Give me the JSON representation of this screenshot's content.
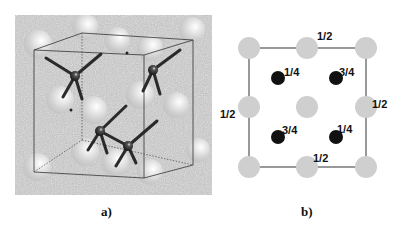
{
  "figure": {
    "panels": [
      {
        "id": "a",
        "label": "a)",
        "description": "3D perspective view of a cubic unit cell with large light spheres and small dark tetrahedrally bonded atoms",
        "background": "#bdbdbd",
        "large_spheres": [
          {
            "x": 38,
            "y": 44,
            "r": 14
          },
          {
            "x": 85,
            "y": 27,
            "r": 13
          },
          {
            "x": 117,
            "y": 40,
            "r": 13
          },
          {
            "x": 150,
            "y": 48,
            "r": 13
          },
          {
            "x": 192,
            "y": 30,
            "r": 13
          },
          {
            "x": 60,
            "y": 100,
            "r": 14
          },
          {
            "x": 93,
            "y": 110,
            "r": 14
          },
          {
            "x": 140,
            "y": 95,
            "r": 14
          },
          {
            "x": 176,
            "y": 105,
            "r": 13
          },
          {
            "x": 85,
            "y": 152,
            "r": 14
          },
          {
            "x": 115,
            "y": 162,
            "r": 14
          },
          {
            "x": 150,
            "y": 172,
            "r": 13
          },
          {
            "x": 37,
            "y": 167,
            "r": 14
          },
          {
            "x": 198,
            "y": 150,
            "r": 12
          }
        ],
        "bonded_atoms": [
          {
            "x": 75,
            "y": 76
          },
          {
            "x": 153,
            "y": 70
          },
          {
            "x": 100,
            "y": 131
          },
          {
            "x": 128,
            "y": 146
          }
        ]
      },
      {
        "id": "b",
        "label": "b)",
        "description": "Top-down projection of the unit cell with fractional heights",
        "large_sphere_color": "#cfcfcf",
        "small_atom_color": "#111111",
        "large_spheres": [
          {
            "x": 249,
            "y": 48
          },
          {
            "x": 307,
            "y": 48
          },
          {
            "x": 366,
            "y": 48
          },
          {
            "x": 249,
            "y": 107
          },
          {
            "x": 307,
            "y": 107
          },
          {
            "x": 366,
            "y": 107
          },
          {
            "x": 249,
            "y": 167
          },
          {
            "x": 307,
            "y": 167
          },
          {
            "x": 366,
            "y": 167
          }
        ],
        "small_atoms": [
          {
            "x": 278,
            "y": 78,
            "height": "1/4"
          },
          {
            "x": 336,
            "y": 78,
            "height": "3/4"
          },
          {
            "x": 278,
            "y": 137,
            "height": "3/4"
          },
          {
            "x": 336,
            "y": 137,
            "height": "1/4"
          }
        ],
        "height_labels": [
          {
            "text": "1/2",
            "position": "top-edge"
          },
          {
            "text": "1/2",
            "position": "left-edge"
          },
          {
            "text": "1/2",
            "position": "right-edge"
          },
          {
            "text": "1/2",
            "position": "bottom-edge"
          },
          {
            "text": "1/4",
            "position": "atom-top-left"
          },
          {
            "text": "3/4",
            "position": "atom-top-right"
          },
          {
            "text": "3/4",
            "position": "atom-bottom-left"
          },
          {
            "text": "1/4",
            "position": "atom-bottom-right"
          }
        ]
      }
    ]
  }
}
